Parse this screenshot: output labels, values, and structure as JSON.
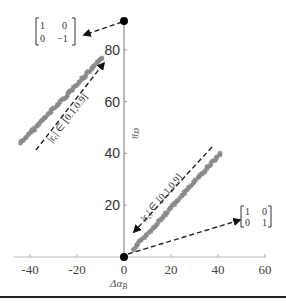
{
  "chart_data": {
    "type": "scatter",
    "title": "",
    "xlabel": "Δα_B",
    "ylabel": "α_B",
    "xlim": [
      -45,
      60
    ],
    "ylim": [
      0,
      90
    ],
    "grid": false,
    "xticks": [
      -40,
      -20,
      0,
      20,
      40,
      60
    ],
    "xtick_labels": [
      "-40",
      "-20",
      "0",
      "20",
      "40",
      "60"
    ],
    "yticks": [
      20,
      40,
      60,
      80
    ],
    "ytick_labels": [
      "20",
      "40",
      "60",
      "80"
    ],
    "series": [
      {
        "name": "upper cluster",
        "color": "#8a8a8a",
        "marker": "asterisk",
        "x_range": [
          -44,
          -9
        ],
        "y_range": [
          44,
          77
        ],
        "points": [
          [
            -44,
            44
          ],
          [
            -40,
            48
          ],
          [
            -36,
            51
          ],
          [
            -32,
            55
          ],
          [
            -28,
            58
          ],
          [
            -24,
            62
          ],
          [
            -20,
            65
          ],
          [
            -16,
            69
          ],
          [
            -12,
            73
          ],
          [
            -9,
            77
          ]
        ]
      },
      {
        "name": "lower cluster",
        "color": "#8a8a8a",
        "marker": "asterisk",
        "x_range": [
          4,
          41
        ],
        "y_range": [
          3,
          40
        ],
        "points": [
          [
            4,
            3
          ],
          [
            8,
            7
          ],
          [
            12,
            11
          ],
          [
            16,
            15
          ],
          [
            20,
            19
          ],
          [
            24,
            23
          ],
          [
            28,
            27
          ],
          [
            32,
            31
          ],
          [
            36,
            35
          ],
          [
            41,
            40
          ]
        ]
      },
      {
        "name": "reference points",
        "color": "#000000",
        "marker": "dot",
        "points": [
          [
            0,
            0
          ],
          [
            0,
            91
          ]
        ]
      }
    ],
    "annotations": [
      {
        "text": "|r_c| ∈ [0.1,0.9]",
        "location": "along upper cluster, dashed arrow pointing up-right"
      },
      {
        "text": "|r_c| ∈ [0.1,0.9]",
        "location": "along lower cluster, dashed arrow pointing down-left"
      },
      {
        "text": "[[1, 0], [0, -1]]",
        "location": "top-left, dashed arrow from point (0,91)"
      },
      {
        "text": "[[1, 0], [0, 1]]",
        "location": "right, dashed arrow from point (0,0)"
      }
    ]
  },
  "labels": {
    "xlabel_main": "Δα",
    "xlabel_sub": "B",
    "ylabel_main": "α",
    "ylabel_sub": "B",
    "range_text": "|r",
    "range_sub": "c",
    "range_rest": "| ∈ [0.1,0.9]"
  },
  "matrices": {
    "top": {
      "r1c1": "1",
      "r1c2": "0",
      "r2c1": "0",
      "r2c2": "−1"
    },
    "right": {
      "r1c1": "1",
      "r1c2": "0",
      "r2c1": "0",
      "r2c2": "1"
    }
  },
  "colors": {
    "scatter": "#8a8a8a",
    "axis": "#777777",
    "dot": "#000000",
    "arrow": "#222222"
  }
}
